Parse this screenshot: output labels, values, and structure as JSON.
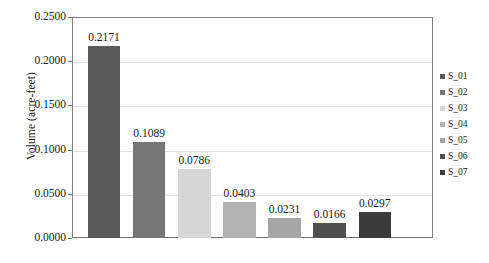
{
  "chart_data": {
    "type": "bar",
    "title": "",
    "subtitle": "",
    "xlabel": "",
    "ylabel": "Volume (acre-feet)",
    "categories": [
      "S_01",
      "S_02",
      "S_03",
      "S_04",
      "S_05",
      "S_06",
      "S_07"
    ],
    "values": [
      0.2171,
      0.1089,
      0.0786,
      0.0403,
      0.0231,
      0.0166,
      0.0297
    ],
    "data_labels": [
      "0.2171",
      "0.1089",
      "0.0786",
      "0.0403",
      "0.0231",
      "0.0166",
      "0.0297"
    ],
    "ylim": [
      0.0,
      0.25
    ],
    "ytick_values": [
      0.0,
      0.05,
      0.1,
      0.15,
      0.2,
      0.25
    ],
    "ytick_labels": [
      "0.0000",
      "0.0500",
      "0.1000",
      "0.1500",
      "0.2000",
      "0.2500"
    ],
    "grid": "horizontal",
    "legend_position": "right",
    "legend": [
      {
        "label": "S_01",
        "color": "#595959"
      },
      {
        "label": "S_02",
        "color": "#767676"
      },
      {
        "label": "S_03",
        "color": "#d6d6d6"
      },
      {
        "label": "S_04",
        "color": "#b3b3b3"
      },
      {
        "label": "S_05",
        "color": "#a6a6a6"
      },
      {
        "label": "S_06",
        "color": "#4f4f4f"
      },
      {
        "label": "S_07",
        "color": "#3b3b3b"
      }
    ],
    "bar_colors": [
      "#595959",
      "#767676",
      "#d6d6d6",
      "#b3b3b3",
      "#a6a6a6",
      "#4f4f4f",
      "#3b3b3b"
    ],
    "colors": {
      "background": "#ffffff",
      "plot_background": "#ffffff",
      "axis_line": "#6d6d6d",
      "frame_line": "#808080",
      "gridline": "#e2e2e2",
      "text": "#1a1a1a"
    }
  }
}
